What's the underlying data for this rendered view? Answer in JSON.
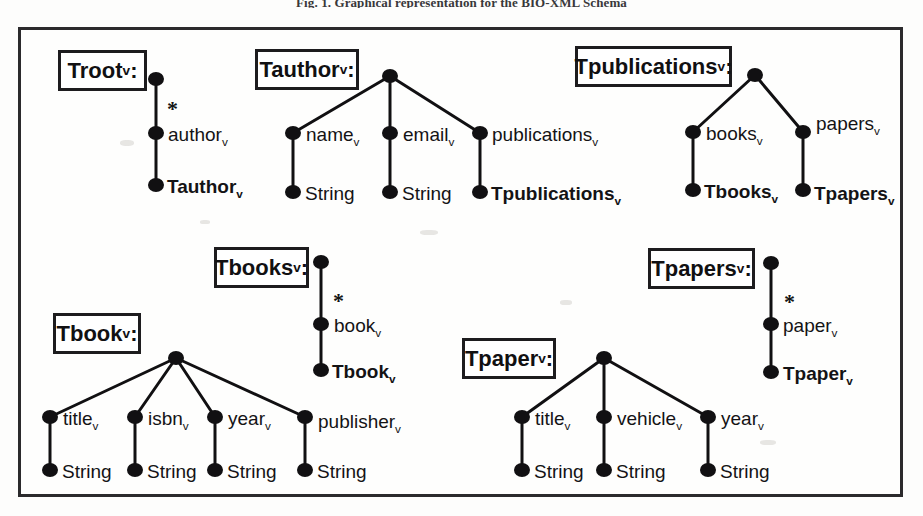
{
  "figure": {
    "caption": "Fig. 1. Graphical representation for the BIO-XML Schema",
    "frame_color": "#2b2a2c",
    "node_color": "#111012",
    "background": "#fdfdfc"
  },
  "trees": [
    {
      "id": "troot",
      "box_label": "Troot",
      "box_label_sub": "v",
      "box_label_suffix": ":",
      "root_node": "root",
      "edges": [
        {
          "label": "author",
          "label_sub": "v",
          "multiplicity": "*"
        }
      ],
      "leaves": [
        {
          "label": "Tauthor",
          "label_sub": "v",
          "kind": "type"
        }
      ]
    },
    {
      "id": "tauthor",
      "box_label": "Tauthor",
      "box_label_sub": "v",
      "box_label_suffix": ":",
      "root_node": "root",
      "edges": [
        {
          "label": "name",
          "label_sub": "v",
          "multiplicity": ""
        },
        {
          "label": "email",
          "label_sub": "v",
          "multiplicity": ""
        },
        {
          "label": "publications",
          "label_sub": "v",
          "multiplicity": ""
        }
      ],
      "leaves": [
        {
          "label": "String",
          "label_sub": "",
          "kind": "string"
        },
        {
          "label": "String",
          "label_sub": "",
          "kind": "string"
        },
        {
          "label": "Tpublications",
          "label_sub": "v",
          "kind": "type"
        }
      ]
    },
    {
      "id": "tpublications",
      "box_label": "Tpublications",
      "box_label_sub": "v",
      "box_label_suffix": ":",
      "root_node": "root",
      "edges": [
        {
          "label": "books",
          "label_sub": "v",
          "multiplicity": ""
        },
        {
          "label": "papers",
          "label_sub": "v",
          "multiplicity": ""
        }
      ],
      "leaves": [
        {
          "label": "Tbooks",
          "label_sub": "v",
          "kind": "type"
        },
        {
          "label": "Tpapers",
          "label_sub": "v",
          "kind": "type"
        }
      ]
    },
    {
      "id": "tbooks",
      "box_label": "Tbooks",
      "box_label_sub": "v",
      "box_label_suffix": ":",
      "root_node": "root",
      "edges": [
        {
          "label": "book",
          "label_sub": "v",
          "multiplicity": "*"
        }
      ],
      "leaves": [
        {
          "label": "Tbook",
          "label_sub": "v",
          "kind": "type"
        }
      ]
    },
    {
      "id": "tpapers",
      "box_label": "Tpapers",
      "box_label_sub": "v",
      "box_label_suffix": ":",
      "root_node": "root",
      "edges": [
        {
          "label": "paper",
          "label_sub": "v",
          "multiplicity": "*"
        }
      ],
      "leaves": [
        {
          "label": "Tpaper",
          "label_sub": "v",
          "kind": "type"
        }
      ]
    },
    {
      "id": "tbook",
      "box_label": "Tbook",
      "box_label_sub": "v",
      "box_label_suffix": ":",
      "root_node": "root",
      "edges": [
        {
          "label": "title",
          "label_sub": "v",
          "multiplicity": ""
        },
        {
          "label": "isbn",
          "label_sub": "v",
          "multiplicity": ""
        },
        {
          "label": "year",
          "label_sub": "v",
          "multiplicity": ""
        },
        {
          "label": "publisher",
          "label_sub": "v",
          "multiplicity": ""
        }
      ],
      "leaves": [
        {
          "label": "String",
          "label_sub": "",
          "kind": "string"
        },
        {
          "label": "String",
          "label_sub": "",
          "kind": "string"
        },
        {
          "label": "String",
          "label_sub": "",
          "kind": "string"
        },
        {
          "label": "String",
          "label_sub": "",
          "kind": "string"
        }
      ]
    },
    {
      "id": "tpaper",
      "box_label": "Tpaper",
      "box_label_sub": "v",
      "box_label_suffix": ":",
      "root_node": "root",
      "edges": [
        {
          "label": "title",
          "label_sub": "v",
          "multiplicity": ""
        },
        {
          "label": "vehicle",
          "label_sub": "v",
          "multiplicity": ""
        },
        {
          "label": "year",
          "label_sub": "v",
          "multiplicity": ""
        }
      ],
      "leaves": [
        {
          "label": "String",
          "label_sub": "",
          "kind": "string"
        },
        {
          "label": "String",
          "label_sub": "",
          "kind": "string"
        },
        {
          "label": "String",
          "label_sub": "",
          "kind": "string"
        }
      ]
    }
  ],
  "labels": {
    "troot_box": "Troot",
    "tauthor_box": "Tauthor",
    "tpublications_box": "Tpublications",
    "tbooks_box": "Tbooks",
    "tpapers_box": "Tpapers",
    "tbook_box": "Tbook",
    "tpaper_box": "Tpaper",
    "sub_v": "v",
    "colon": ":",
    "star": "*",
    "string": "String",
    "author": "author",
    "name": "name",
    "email": "email",
    "publications": "publications",
    "books": "books",
    "papers": "papers",
    "book": "book",
    "paper": "paper",
    "title": "title",
    "isbn": "isbn",
    "year": "year",
    "publisher": "publisher",
    "vehicle": "vehicle",
    "t_author": "Tauthor",
    "t_publications": "Tpublications",
    "t_books": "Tbooks",
    "t_papers": "Tpapers",
    "t_book": "Tbook",
    "t_paper": "Tpaper"
  }
}
